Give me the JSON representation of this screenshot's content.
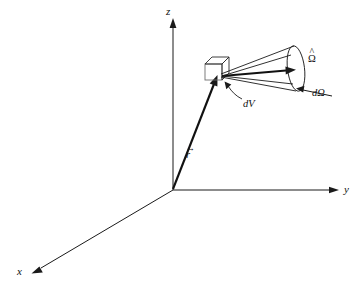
{
  "figure": {
    "type": "3d-vector-diagram",
    "background_color": "#ffffff",
    "line_color": "#1a1a1a"
  },
  "axes": {
    "z": {
      "label": "z",
      "origin": [
        173,
        190
      ],
      "tip": [
        173,
        22
      ]
    },
    "y": {
      "label": "y",
      "origin": [
        173,
        190
      ],
      "tip": [
        338,
        190
      ]
    },
    "x": {
      "label": "x",
      "origin": [
        173,
        190
      ],
      "tip": [
        32,
        273
      ]
    }
  },
  "vectors": {
    "position": {
      "label": "r",
      "accent": "→",
      "from": [
        173,
        190
      ],
      "to": [
        216,
        80
      ]
    },
    "direction": {
      "label": "Ω",
      "accent": "^",
      "from": [
        222,
        76
      ],
      "to": [
        295,
        70
      ]
    }
  },
  "elements": {
    "volume": {
      "label": "dV",
      "shape": "cube",
      "leader_from": [
        241,
        98
      ],
      "leader_to": [
        224,
        84
      ]
    },
    "solid_angle": {
      "label": "dΩ",
      "shape": "cone",
      "leader_from": [
        331,
        96
      ],
      "leader_to": [
        297,
        89
      ]
    }
  },
  "labels": {
    "z_axis": "z",
    "y_axis": "y",
    "x_axis": "x",
    "volume_element": "dV",
    "solid_angle": "dΩ",
    "position_vector": "r",
    "direction_unit_vector": "Ω"
  },
  "accents": {
    "vector_arrow": "→",
    "hat": "^"
  }
}
